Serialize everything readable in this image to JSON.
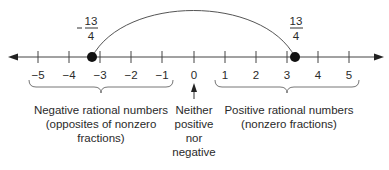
{
  "number_line": {
    "min": -5,
    "max": 5,
    "ticks": [
      "−5",
      "−4",
      "−3",
      "−2",
      "−1",
      "0",
      "1",
      "2",
      "3",
      "4",
      "5"
    ],
    "points": [
      {
        "value": -3.25,
        "label_sign": "−",
        "label_num": "13",
        "label_den": "4"
      },
      {
        "value": 3.25,
        "label_sign": "",
        "label_num": "13",
        "label_den": "4"
      }
    ],
    "arc": {
      "from": -3.25,
      "to": 3.25
    }
  },
  "groups": {
    "negative": {
      "line1": "Negative rational numbers",
      "line2": "(opposites of nonzero",
      "line3": "fractions)"
    },
    "zero": {
      "line1": "Neither",
      "line2": "positive",
      "line3": "nor",
      "line4": "negative"
    },
    "positive": {
      "line1": "Positive rational numbers",
      "line2": "(nonzero fractions)"
    }
  },
  "colors": {
    "line": "#333333",
    "text": "#2a2a2a"
  }
}
